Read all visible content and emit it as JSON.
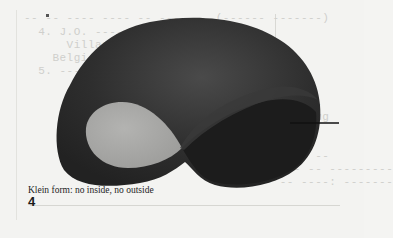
{
  "figure": {
    "caption": "Klein form: no inside, no outside",
    "number": "4",
    "colors": {
      "background": "#f3f3f1",
      "outer_band": "#2a2a2a",
      "inner_loop_fill": "#a9a9a7",
      "right_lobe": "#1f1f1f",
      "pointer_line": "#111111"
    }
  },
  "background_bleed_text": {
    "lines": [
      "-- -- ---- ---- -- ------  (------ -------)",
      "  4. J.O. ------",
      "      Villag---",
      "    Belgi--",
      "  5. ---",
      "",
      "                                      ----",
      "                                   -----,ug",
      "",
      "                                   ---: ",
      "                                   ----- --",
      "                                 ------ -- ---------",
      "                                 -- -- ----: -------",
      "                                 ----- ----"
    ]
  }
}
